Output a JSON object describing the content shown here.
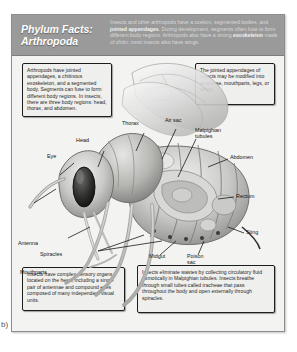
{
  "figure": {
    "marker": "b)"
  },
  "header": {
    "title_line1": "Phylum Facts:",
    "title_line2": "Arthropoda",
    "body_pre": "Insects and other arthropods have a coelom, segmented bodies, and ",
    "body_bold1": "jointed appendages",
    "body_mid": ". During development, segments often fuse to form different body regions. Arthropods also have a strong ",
    "body_bold2": "exoskeleton",
    "body_post": " made of chitin; most insects also have wings."
  },
  "fact_boxes": {
    "appendages": "Arthropods have jointed appendages, a chitinous exoskeleton, and a segmented body. Segments can fuse to form different body regions. In insects, there are three body regions: head, thorax, and abdomen.",
    "modified": "The jointed appendages of insects may be modified into antennae, mouthparts, legs, or wings.",
    "sensory": "Insects have complex sensory organs located on the head, including a single pair of antennae and compound eyes composed of many independent visual units.",
    "excretion": "Insects eliminate wastes by collecting circulatory fluid osmotically in Malpighian tubules. Insects breathe through small tubes called tracheae that pass throughout the body and open externally through spiracles."
  },
  "anatomy_labels": {
    "antenna": "Antenna",
    "eye": "Eye",
    "head": "Head",
    "thorax": "Thorax",
    "mouthparts": "Mouthparts",
    "air_sac": "Air sac",
    "malpighian_tubules": "Malpighian tubules",
    "abdomen": "Abdomen",
    "rectum": "Rectum",
    "sting": "Sting",
    "spiracles": "Spiracles",
    "midgut": "Midgut",
    "poison_sac": "Poison sac"
  },
  "colors": {
    "header_band": "#9a9a9a",
    "poster_bg": "#f3f3f1",
    "box_bg": "#efefee",
    "box_border": "#1d1d1d",
    "label_text": "#161616"
  }
}
